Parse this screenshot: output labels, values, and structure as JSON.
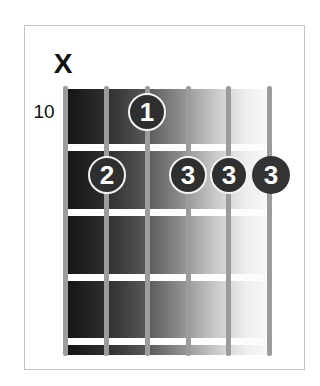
{
  "chord_diagram": {
    "muted_marker": "X",
    "muted_string": 1,
    "start_fret_label": "10",
    "strings": 6,
    "frets_shown": 4,
    "fingerings": [
      {
        "string": 3,
        "fret": 1,
        "finger": "1"
      },
      {
        "string": 2,
        "fret": 2,
        "finger": "2"
      },
      {
        "string": 4,
        "fret": 2,
        "finger": "3"
      },
      {
        "string": 5,
        "fret": 2,
        "finger": "3"
      },
      {
        "string": 6,
        "fret": 2,
        "finger": "3"
      }
    ],
    "colors": {
      "dot_fill": "#2f2f2f",
      "dot_ring": "#f2f2f2",
      "string": "#9c9c9c",
      "fret": "#ffffff",
      "frame_border": "#c4c4c4"
    }
  }
}
